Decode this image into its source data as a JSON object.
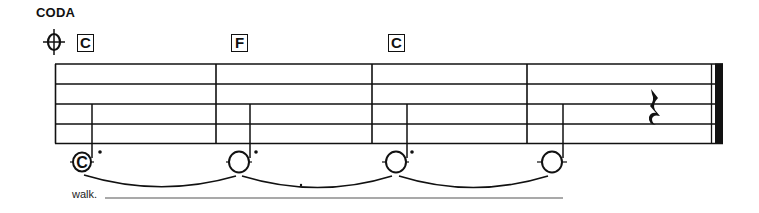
{
  "section": {
    "title": "CODA",
    "symbol": "coda-sign"
  },
  "chords": [
    {
      "label": "C",
      "measure": 1
    },
    {
      "label": "F",
      "measure": 2
    },
    {
      "label": "C",
      "measure": 3
    }
  ],
  "staff": {
    "lines": 5,
    "measures": 4,
    "final_barline": "thin-thick"
  },
  "notes": [
    {
      "measure": 1,
      "type": "dotted-half",
      "head_label": "C",
      "tied_to_next": true
    },
    {
      "measure": 2,
      "type": "dotted-half",
      "head_label": "",
      "tied_to_next": true
    },
    {
      "measure": 3,
      "type": "dotted-half",
      "head_label": "",
      "tied_to_next": true
    },
    {
      "measure": 4,
      "type": "half",
      "head_label": "",
      "tied_to_next": false,
      "rest_after": "quarter-rest"
    }
  ],
  "lyrics": {
    "text": "walk."
  }
}
